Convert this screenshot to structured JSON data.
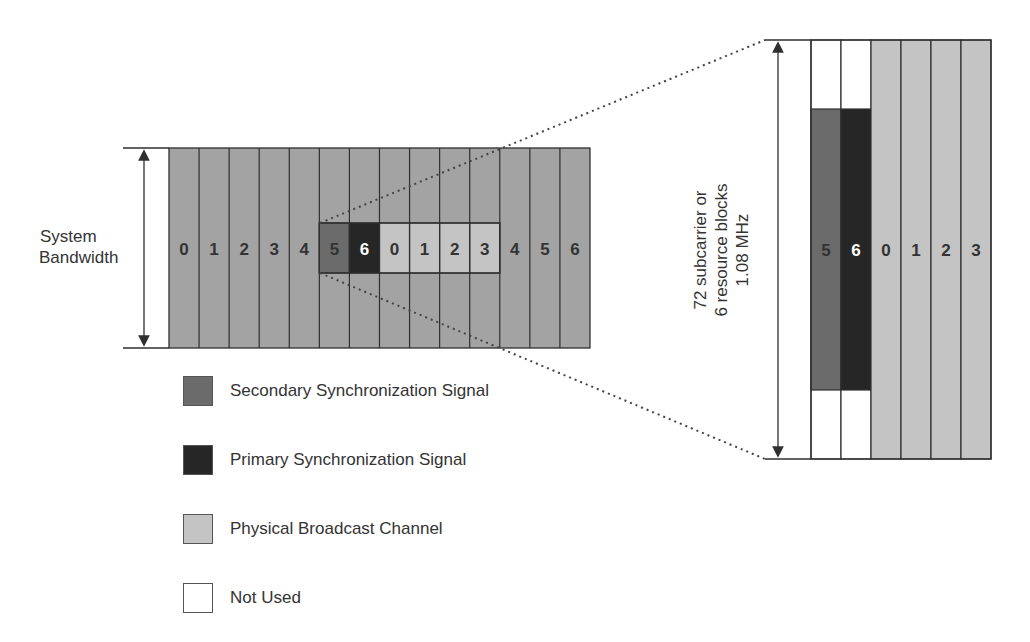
{
  "colors": {
    "background": "#ffffff",
    "resource_grid": "#a3a3a3",
    "sss": "#6b6b6b",
    "pss": "#262626",
    "pbch": "#c4c4c4",
    "not_used": "#ffffff",
    "lines": "#2f2f2f"
  },
  "left_panel": {
    "bandwidth_label_line1": "System",
    "bandwidth_label_line2": "Bandwidth",
    "column_labels": [
      "0",
      "1",
      "2",
      "3",
      "4",
      "5",
      "6",
      "0",
      "1",
      "2",
      "3",
      "4",
      "5",
      "6"
    ],
    "highlight_cells": [
      {
        "label": "5",
        "type": "sss"
      },
      {
        "label": "6",
        "type": "pss"
      },
      {
        "label": "0",
        "type": "pbch"
      },
      {
        "label": "1",
        "type": "pbch"
      },
      {
        "label": "2",
        "type": "pbch"
      },
      {
        "label": "3",
        "type": "pbch"
      }
    ]
  },
  "right_panel": {
    "dimension_label_line1": "72 subcarrier or",
    "dimension_label_line2": "6 resource blocks",
    "dimension_label_line3": "1.08 MHz",
    "column_labels": [
      "5",
      "6",
      "0",
      "1",
      "2",
      "3"
    ],
    "column_types": [
      "sss",
      "pss",
      "pbch",
      "pbch",
      "pbch",
      "pbch"
    ]
  },
  "legend": {
    "items": [
      {
        "label": "Secondary Synchronization Signal",
        "type": "sss"
      },
      {
        "label": "Primary Synchronization Signal",
        "type": "pss"
      },
      {
        "label": "Physical Broadcast Channel",
        "type": "pbch"
      },
      {
        "label": "Not Used",
        "type": "not_used"
      }
    ]
  }
}
